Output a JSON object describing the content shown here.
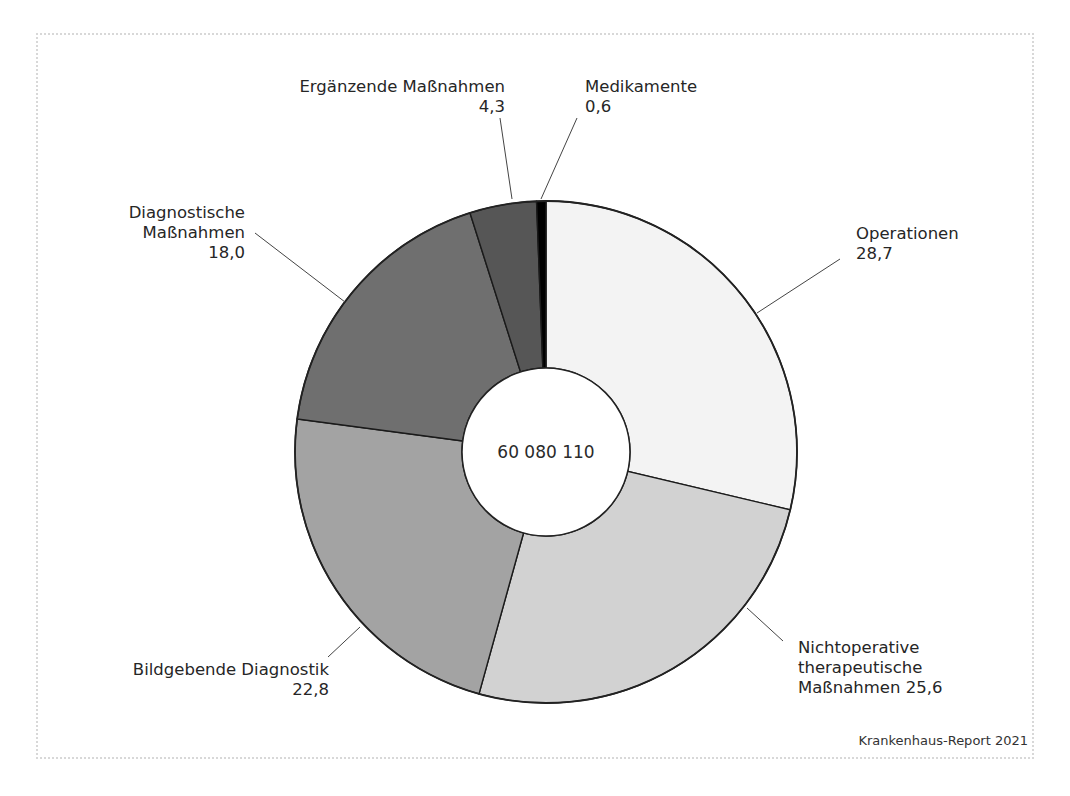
{
  "chart_data": {
    "type": "pie",
    "variant": "donut",
    "title": "",
    "center_label": "60 080 110",
    "unit": "%",
    "source": "Krankenhaus-Report 2021",
    "categories": [
      "Operationen",
      "Nichtoperative therapeutische Maßnahmen",
      "Bildgebende Diagnostik",
      "Diagnostische Maßnahmen",
      "Ergänzende Maßnahmen",
      "Medikamente"
    ],
    "values": [
      28.7,
      25.6,
      22.8,
      18.0,
      4.3,
      0.6
    ],
    "colors": [
      "#f3f3f3",
      "#d2d2d2",
      "#a3a3a3",
      "#6f6f6f",
      "#565656",
      "#000000"
    ],
    "start_angle_deg": 0,
    "direction": "clockwise",
    "legend": "none (direct labels with leader lines)"
  },
  "labels": {
    "operationen": {
      "name": "Operationen",
      "value": "28,7"
    },
    "nichtoperative": {
      "line1": "Nichtoperative",
      "line2": "therapeutische",
      "line3": "Maßnahmen 25,6"
    },
    "bildgebende": {
      "name": "Bildgebende Diagnostik",
      "value": "22,8"
    },
    "diagnostische": {
      "line1": "Diagnostische",
      "line2": "Maßnahmen",
      "value": "18,0"
    },
    "ergaenzende": {
      "name": "Ergänzende Maßnahmen",
      "value": "4,3"
    },
    "medikamente": {
      "name": "Medikamente",
      "value": "0,6"
    }
  },
  "center": {
    "value": "60 080 110"
  },
  "footer": {
    "source": "Krankenhaus-Report 2021"
  }
}
